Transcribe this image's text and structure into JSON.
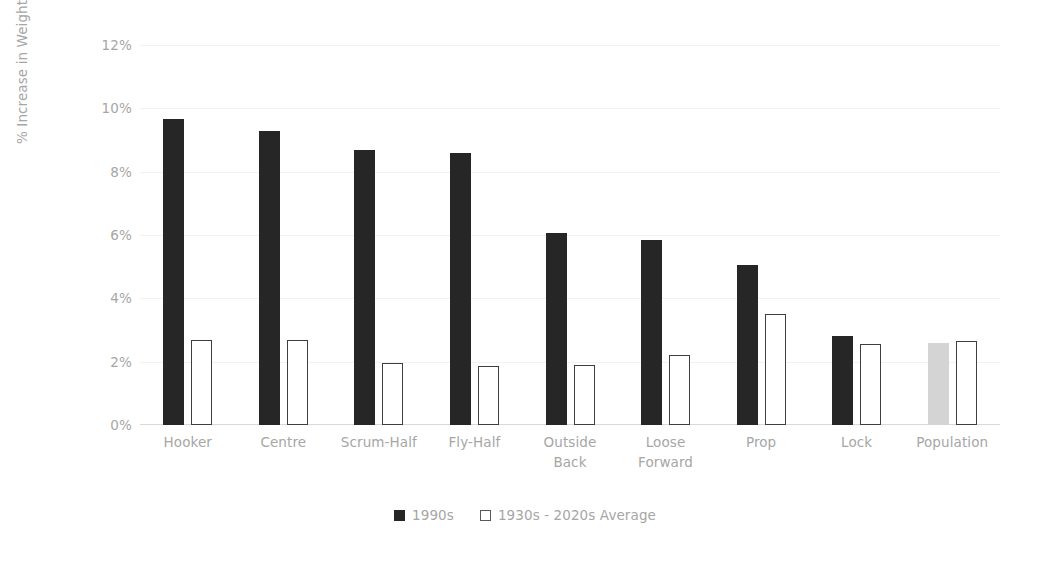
{
  "chart_data": {
    "type": "bar",
    "title": "",
    "subtitle": "",
    "xlabel": "",
    "ylabel": "% Increase in Weight",
    "ylim": [
      0,
      12
    ],
    "ytick_values": [
      0,
      2,
      4,
      6,
      8,
      10,
      12
    ],
    "ytick_labels": [
      "0%",
      "2%",
      "4%",
      "6%",
      "8%",
      "10%",
      "12%"
    ],
    "grid": true,
    "grid_axis": "y",
    "legend_position": "bottom",
    "value_unit": "%",
    "categories": [
      "Hooker",
      "Centre",
      "Scrum-Half",
      "Fly-Half",
      "Outside Back",
      "Loose Forward",
      "Prop",
      "Lock",
      "Population"
    ],
    "category_lines": [
      [
        "Hooker"
      ],
      [
        "Centre"
      ],
      [
        "Scrum-Half"
      ],
      [
        "Fly-Half"
      ],
      [
        "Outside",
        "Back"
      ],
      [
        "Loose",
        "Forward"
      ],
      [
        "Prop"
      ],
      [
        "Lock"
      ],
      [
        "Population"
      ]
    ],
    "series": [
      {
        "name": "1990s",
        "color": "#262626",
        "style": "filled",
        "values": [
          9.65,
          9.3,
          8.7,
          8.6,
          6.05,
          5.85,
          5.05,
          2.8,
          2.6
        ],
        "point_colors": [
          "#262626",
          "#262626",
          "#262626",
          "#262626",
          "#262626",
          "#262626",
          "#262626",
          "#262626",
          "#d4d4d4"
        ]
      },
      {
        "name": "1930s - 2020s Average",
        "color": "#ffffff",
        "style": "outline",
        "values": [
          2.7,
          2.7,
          1.95,
          1.85,
          1.9,
          2.2,
          3.5,
          2.55,
          2.65
        ]
      }
    ]
  },
  "legend": {
    "items": [
      {
        "label": "1990s",
        "swatch": "filled-square"
      },
      {
        "label": "1930s - 2020s Average",
        "swatch": "outline-square"
      }
    ]
  },
  "colors": {
    "series1": "#262626",
    "series1_population": "#d4d4d4",
    "series2_fill": "#ffffff",
    "series2_stroke": "#3f3f3f",
    "gridline": "#f2f2f2",
    "axis": "#d9d9d9",
    "text": "#a6a6a6",
    "background": "#ffffff"
  }
}
